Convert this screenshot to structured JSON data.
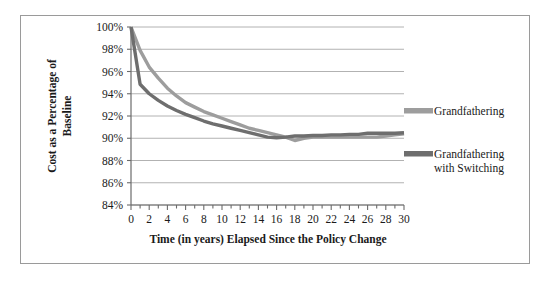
{
  "chart_data": {
    "type": "line",
    "title": "",
    "xlabel": "Time (in years) Elapsed Since the Policy Change",
    "ylabel": "Cost as a Percentage of Baseline",
    "ylabel_line1": "Cost as a Percentage of",
    "ylabel_line2": "Baseline",
    "grid": true,
    "legend_position": "right",
    "xlim": [
      0,
      30
    ],
    "ylim": [
      84,
      100
    ],
    "ytick_labels": [
      "100%",
      "98%",
      "96%",
      "94%",
      "92%",
      "90%",
      "88%",
      "86%",
      "84%"
    ],
    "ytick_values": [
      100,
      98,
      96,
      94,
      92,
      90,
      88,
      86,
      84
    ],
    "xtick_labels": [
      "0",
      "2",
      "4",
      "6",
      "8",
      "10",
      "12",
      "14",
      "16",
      "18",
      "20",
      "22",
      "24",
      "26",
      "28",
      "30"
    ],
    "xtick_values": [
      0,
      2,
      4,
      6,
      8,
      10,
      12,
      14,
      16,
      18,
      20,
      22,
      24,
      26,
      28,
      30
    ],
    "x": [
      0,
      1,
      2,
      3,
      4,
      5,
      6,
      7,
      8,
      9,
      10,
      11,
      12,
      13,
      14,
      15,
      16,
      17,
      18,
      19,
      20,
      21,
      22,
      23,
      24,
      25,
      26,
      27,
      28,
      29,
      30
    ],
    "series": [
      {
        "name": "Grandfathering",
        "color": "#9d9d9d",
        "values": [
          100.0,
          97.9,
          96.4,
          95.4,
          94.5,
          93.8,
          93.2,
          92.8,
          92.4,
          92.1,
          91.8,
          91.5,
          91.2,
          90.9,
          90.7,
          90.5,
          90.3,
          90.1,
          89.8,
          90.0,
          90.1,
          90.1,
          90.1,
          90.1,
          90.1,
          90.1,
          90.1,
          90.1,
          90.2,
          90.3,
          90.4
        ]
      },
      {
        "name": "Grandfathering with Switching",
        "name_line1": "Grandfathering",
        "name_line2": "with Switching",
        "color": "#6e6e6e",
        "values": [
          100.0,
          94.85,
          94.0,
          93.4,
          92.9,
          92.5,
          92.15,
          91.85,
          91.55,
          91.3,
          91.1,
          90.9,
          90.7,
          90.5,
          90.3,
          90.1,
          90.05,
          90.1,
          90.2,
          90.2,
          90.25,
          90.25,
          90.3,
          90.3,
          90.35,
          90.35,
          90.45,
          90.45,
          90.45,
          90.45,
          90.5
        ]
      }
    ]
  },
  "legend": {
    "items": [
      {
        "label": "Grandfathering"
      },
      {
        "label_line1": "Grandfathering",
        "label_line2": "with Switching"
      }
    ]
  },
  "colors": {
    "series_light": "#9d9d9d",
    "series_dark": "#6e6e6e",
    "grid": "#a9a9a9",
    "axis": "#6b6b6b",
    "frame": "#9a9a9a",
    "text": "#1a1a1a"
  }
}
